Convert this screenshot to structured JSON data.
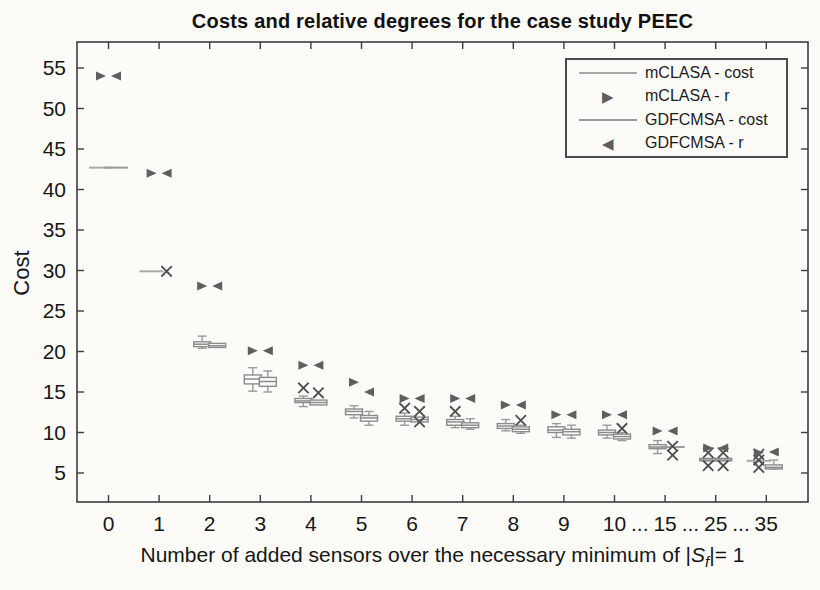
{
  "colors": {
    "background": "#fcfbf8",
    "axis": "#3d3d3d",
    "text": "#161616",
    "box_stroke": "#8c8c8c",
    "box_fill": "#fdfcf9",
    "whisker": "#9a9a9a",
    "triangle_marker": "#5f5f5f",
    "x_marker": "#4f4f4f",
    "mclasa_line": "#a9a9a9",
    "gdfcmsa_line": "#9b9b9b"
  },
  "legend": {
    "items": [
      {
        "label": "mCLASA - cost",
        "type": "line"
      },
      {
        "label": "mCLASA - r",
        "type": "triangle-right"
      },
      {
        "label": "GDFCMSA - cost",
        "type": "line"
      },
      {
        "label": "GDFCMSA - r",
        "type": "triangle-left"
      }
    ]
  },
  "chart_data": {
    "type": "boxplot+scatter",
    "title": "Costs and relative degrees for the case study PEEC",
    "ylabel": "Cost",
    "xlabel": {
      "prefix": "Number of added sensors over the necessary minimum of |",
      "var": "S",
      "sub": "f",
      "suffix": "|= 1"
    },
    "yticks": [
      5,
      10,
      15,
      20,
      25,
      30,
      35,
      40,
      45,
      50,
      55
    ],
    "ylim": [
      1.4,
      58.3
    ],
    "grid": false,
    "legend_position": "top-right",
    "categories": [
      "0",
      "1",
      "2",
      "3",
      "4",
      "5",
      "6",
      "7",
      "8",
      "9",
      "10",
      "15",
      "25",
      "35"
    ],
    "ellipsis": "...",
    "ellipsis_after_indices": [
      10,
      11,
      12
    ],
    "series": [
      {
        "name": "mCLASA",
        "marker": "triangle-right",
        "r": [
          54.0,
          42.0,
          28.1,
          20.1,
          18.3,
          16.2,
          14.2,
          14.2,
          13.4,
          12.2,
          12.2,
          10.2,
          8.1,
          7.5
        ],
        "cost": [
          {
            "median": 42.7,
            "q": null,
            "whiskers": null,
            "outliers": []
          },
          {
            "median": 29.9,
            "q": null,
            "whiskers": null,
            "outliers": []
          },
          {
            "median": 20.9,
            "q": [
              20.6,
              21.2
            ],
            "whiskers": [
              20.4,
              21.9
            ],
            "outliers": []
          },
          {
            "median": 16.6,
            "q": [
              16.0,
              17.1
            ],
            "whiskers": [
              15.1,
              18.0
            ],
            "outliers": []
          },
          {
            "median": 13.9,
            "q": [
              13.7,
              14.2
            ],
            "whiskers": [
              13.2,
              14.5
            ],
            "outliers": [
              15.5
            ]
          },
          {
            "median": 12.6,
            "q": [
              12.2,
              12.9
            ],
            "whiskers": [
              11.8,
              13.3
            ],
            "outliers": []
          },
          {
            "median": 11.7,
            "q": [
              11.4,
              12.0
            ],
            "whiskers": [
              10.9,
              12.4
            ],
            "outliers": [
              13.0
            ]
          },
          {
            "median": 11.3,
            "q": [
              10.9,
              11.6
            ],
            "whiskers": [
              10.6,
              12.0
            ],
            "outliers": [
              12.6
            ]
          },
          {
            "median": 10.8,
            "q": [
              10.5,
              11.1
            ],
            "whiskers": [
              10.2,
              11.6
            ],
            "outliers": []
          },
          {
            "median": 10.3,
            "q": [
              10.0,
              10.7
            ],
            "whiskers": [
              9.4,
              11.1
            ],
            "outliers": []
          },
          {
            "median": 10.0,
            "q": [
              9.7,
              10.3
            ],
            "whiskers": [
              9.3,
              10.9
            ],
            "outliers": []
          },
          {
            "median": 8.2,
            "q": [
              8.0,
              8.5
            ],
            "whiskers": [
              7.4,
              9.0
            ],
            "outliers": []
          },
          {
            "median": 6.6,
            "q": [
              6.5,
              6.8
            ],
            "whiskers": null,
            "outliers": [
              7.5,
              5.9
            ]
          },
          {
            "median": 6.5,
            "q": null,
            "whiskers": null,
            "outliers": [
              7.3,
              6.6,
              5.7
            ]
          }
        ]
      },
      {
        "name": "GDFCMSA",
        "marker": "triangle-left",
        "r": [
          54.0,
          42.0,
          28.1,
          20.1,
          18.3,
          15.0,
          14.2,
          14.2,
          13.4,
          12.2,
          12.2,
          10.2,
          8.1,
          7.6
        ],
        "cost": [
          {
            "median": 42.7,
            "q": null,
            "whiskers": null,
            "outliers": []
          },
          {
            "median": null,
            "q": null,
            "whiskers": null,
            "outliers": [
              29.9
            ]
          },
          {
            "median": 20.7,
            "q": [
              20.5,
              21.0
            ],
            "whiskers": null,
            "outliers": []
          },
          {
            "median": 16.3,
            "q": [
              15.7,
              16.8
            ],
            "whiskers": [
              15.0,
              17.6
            ],
            "outliers": []
          },
          {
            "median": 13.7,
            "q": [
              13.4,
              14.0
            ],
            "whiskers": null,
            "outliers": [
              14.9
            ]
          },
          {
            "median": 11.8,
            "q": [
              11.4,
              12.1
            ],
            "whiskers": [
              10.9,
              12.6
            ],
            "outliers": []
          },
          {
            "median": 11.6,
            "q": [
              11.3,
              11.9
            ],
            "whiskers": null,
            "outliers": [
              12.6,
              11.3
            ]
          },
          {
            "median": 10.9,
            "q": [
              10.6,
              11.2
            ],
            "whiskers": [
              10.4,
              11.7
            ],
            "outliers": []
          },
          {
            "median": 10.4,
            "q": [
              10.1,
              10.7
            ],
            "whiskers": [
              9.9,
              10.9
            ],
            "outliers": [
              11.5
            ]
          },
          {
            "median": 10.1,
            "q": [
              9.7,
              10.4
            ],
            "whiskers": [
              9.3,
              10.9
            ],
            "outliers": []
          },
          {
            "median": 9.5,
            "q": [
              9.2,
              9.8
            ],
            "whiskers": [
              9.0,
              10.0
            ],
            "outliers": [
              10.5
            ]
          },
          {
            "median": 8.2,
            "q": null,
            "whiskers": null,
            "outliers": [
              8.3,
              7.2
            ]
          },
          {
            "median": 6.6,
            "q": [
              6.5,
              6.8
            ],
            "whiskers": null,
            "outliers": [
              7.5,
              5.9
            ]
          },
          {
            "median": 5.7,
            "q": [
              5.5,
              6.0
            ],
            "whiskers": [
              5.5,
              6.6
            ],
            "outliers": []
          }
        ]
      }
    ]
  }
}
